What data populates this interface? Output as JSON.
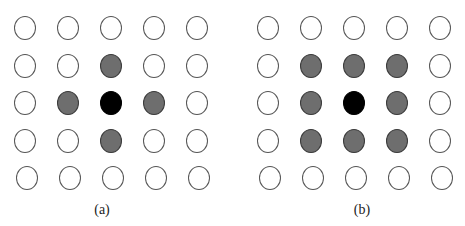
{
  "figure": {
    "panels": [
      {
        "id": "a",
        "caption": "(a)",
        "grid": [
          [
            "empty",
            "empty",
            "empty",
            "empty",
            "empty"
          ],
          [
            "empty",
            "empty",
            "gray",
            "empty",
            "empty"
          ],
          [
            "empty",
            "gray",
            "black",
            "gray",
            "empty"
          ],
          [
            "empty",
            "empty",
            "gray",
            "empty",
            "empty"
          ],
          [
            "empty",
            "empty",
            "empty",
            "empty",
            "empty"
          ]
        ]
      },
      {
        "id": "b",
        "caption": "(b)",
        "grid": [
          [
            "empty",
            "empty",
            "empty",
            "empty",
            "empty"
          ],
          [
            "empty",
            "gray",
            "gray",
            "gray",
            "empty"
          ],
          [
            "empty",
            "gray",
            "black",
            "gray",
            "empty"
          ],
          [
            "empty",
            "gray",
            "gray",
            "gray",
            "empty"
          ],
          [
            "empty",
            "empty",
            "empty",
            "empty",
            "empty"
          ]
        ]
      }
    ],
    "colors": {
      "empty": "#ffffff",
      "gray": "#6e6e6e",
      "black": "#000000",
      "outline": "#555555"
    }
  }
}
